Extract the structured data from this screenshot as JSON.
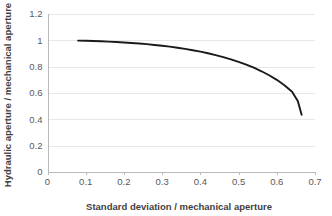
{
  "chart_data": {
    "type": "line",
    "title": "",
    "subtitle": "",
    "xlabel": "Standard deviation / mechanical aperture",
    "ylabel": "Hydraulic aperture / mechanical aperture",
    "xlim": [
      0,
      0.7
    ],
    "ylim": [
      0,
      1.2
    ],
    "xticks": [
      0,
      0.1,
      0.2,
      0.3,
      0.4,
      0.5,
      0.6,
      0.7
    ],
    "xtick_labels": [
      "0",
      "0.1",
      "0.2",
      "0.3",
      "0.4",
      "0.5",
      "0.6",
      "0.7"
    ],
    "yticks": [
      0,
      0.2,
      0.4,
      0.6,
      0.8,
      1,
      1.2
    ],
    "ytick_labels": [
      "0",
      "0.2",
      "0.4",
      "0.6",
      "0.8",
      "1",
      "1.2"
    ],
    "grid": {
      "horizontal": true,
      "vertical": false
    },
    "legend": {
      "visible": false,
      "position": "none"
    },
    "annotations": [],
    "series": [
      {
        "name": "hydraulic-to-mechanical aperture ratio",
        "color": "#1a1a1a",
        "line_width": 1.9,
        "marker": "none",
        "x": [
          0.08,
          0.1,
          0.12,
          0.14,
          0.16,
          0.18,
          0.2,
          0.22,
          0.24,
          0.26,
          0.28,
          0.3,
          0.32,
          0.34,
          0.36,
          0.38,
          0.4,
          0.42,
          0.44,
          0.46,
          0.48,
          0.5,
          0.52,
          0.54,
          0.56,
          0.58,
          0.6,
          0.62,
          0.64,
          0.655,
          0.665
        ],
        "y": [
          0.998,
          0.997,
          0.995,
          0.993,
          0.99,
          0.987,
          0.984,
          0.98,
          0.976,
          0.971,
          0.965,
          0.959,
          0.952,
          0.944,
          0.935,
          0.925,
          0.914,
          0.902,
          0.888,
          0.873,
          0.856,
          0.837,
          0.816,
          0.792,
          0.765,
          0.735,
          0.7,
          0.659,
          0.61,
          0.54,
          0.435
        ]
      }
    ]
  },
  "colors": {
    "series": "#1a1a1a",
    "gridline": "#e8e8ec",
    "axis": "#b9b9bd",
    "tick_text": "#595959",
    "title_text": "#3f3f3f",
    "background": "#ffffff"
  }
}
